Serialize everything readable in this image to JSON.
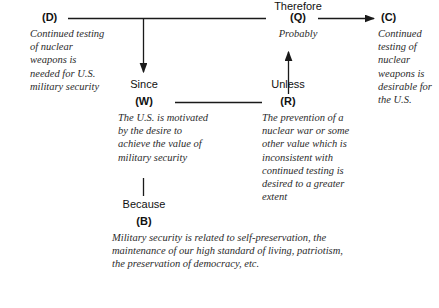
{
  "diagram": {
    "type": "toulmin-argument-diagram",
    "title": "",
    "line_color": "#1a1a1a",
    "text_color": "#2b2b2b",
    "tag_color": "#111111",
    "background": "#ffffff"
  },
  "nodes": {
    "d": {
      "tag": "(D)",
      "text": "Continued testing of nuclear weapons is needed for U.S. military security"
    },
    "q": {
      "tag": "(Q)",
      "text": "Probably"
    },
    "c": {
      "tag": "(C)",
      "text": "Continued testing of nuclear weapons is desirable for the U.S."
    },
    "w": {
      "tag": "(W)",
      "text": "The U.S. is motivated by the desire to achieve the value of military security"
    },
    "r": {
      "tag": "(R)",
      "text": "The prevention of a nuclear war or some other value which is inconsistent with continued testing is desired to a greater extent"
    },
    "b": {
      "tag": "(B)",
      "text": "Military security is related to self-preservation, the maintenance of our high standard of living, patriotism, the preservation of democracy, etc."
    }
  },
  "connectives": {
    "therefore": "Therefore",
    "since": "Since",
    "unless": "Unless",
    "because": "Because"
  },
  "edges": [
    {
      "name": "d-to-q",
      "from": "(D)",
      "to": "(Q)",
      "label": "Therefore",
      "style": "plain-line"
    },
    {
      "name": "q-to-c",
      "from": "(Q)",
      "to": "(C)",
      "label": "",
      "style": "arrow"
    },
    {
      "name": "d-q-down-to-w",
      "from": "(D)-(Q) link",
      "to": "(W)",
      "label": "Since",
      "style": "arrow-down"
    },
    {
      "name": "w-to-r",
      "from": "(W)",
      "to": "(R)",
      "label": "",
      "style": "plain-line"
    },
    {
      "name": "r-up-to-q",
      "from": "(R)",
      "to": "(Q)",
      "label": "Unless",
      "style": "arrow-up"
    },
    {
      "name": "w-down-to-b",
      "from": "(W)",
      "to": "(B)",
      "label": "Because",
      "style": "plain-line"
    }
  ]
}
